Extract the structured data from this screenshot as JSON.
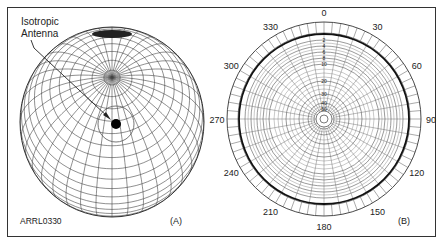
{
  "figure": {
    "id_label": "ARRL0330",
    "panels": [
      {
        "id": "A",
        "caption": "(A)",
        "description": "3D sphere radiation pattern of an isotropic antenna",
        "annotation": {
          "line1": "Isotropic",
          "line2": "Antenna"
        }
      },
      {
        "id": "B",
        "caption": "(B)",
        "description": "Polar plot of isotropic antenna pattern",
        "angle_labels": [
          "0",
          "30",
          "60",
          "90",
          "120",
          "150",
          "180",
          "210",
          "240",
          "270",
          "300",
          "330"
        ],
        "db_labels": [
          "2",
          "4",
          "6",
          "8",
          "10",
          "20",
          "30",
          "40",
          "50"
        ]
      }
    ]
  },
  "colors": {
    "line": "#333333",
    "grid": "#555555",
    "background": "#ffffff"
  }
}
